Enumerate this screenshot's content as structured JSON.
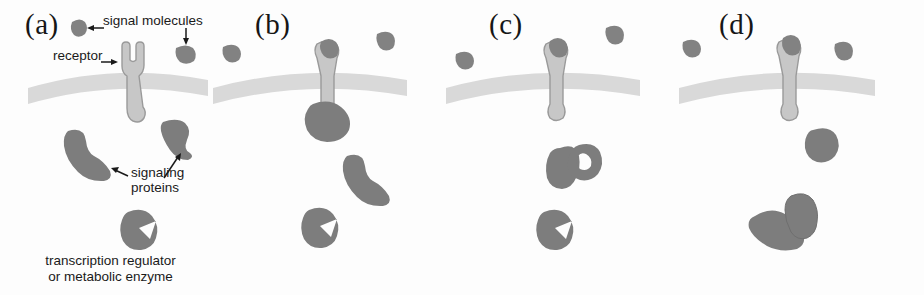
{
  "figure": {
    "type": "diagram",
    "background": "#fdfdfd",
    "width": 924,
    "height": 295
  },
  "colors": {
    "membrane": "#d9d9d9",
    "membrane_edge": "#cccccc",
    "receptor_fill": "#c7c7c7",
    "receptor_stroke": "#9a9a9a",
    "protein_fill": "#7d7d7d",
    "protein_stroke": "#6f6f6f",
    "signal_fill": "#828282",
    "text": "#1a1a1a",
    "panel_label": "#161616"
  },
  "panels": [
    {
      "id": "a",
      "label": "(a)",
      "state": "resting: signal molecules free, receptor unbound, signaling proteins inactive",
      "labels": {
        "signal_molecules": "signal molecules",
        "receptor": "receptor",
        "signaling_proteins_line1": "signaling",
        "signaling_proteins_line2": "proteins",
        "effector_line1": "transcription regulator",
        "effector_line2": "or metabolic enzyme"
      }
    },
    {
      "id": "b",
      "label": "(b)",
      "state": "signal molecule bound in receptor cleft; first signaling protein docked at cytoplasmic tail"
    },
    {
      "id": "c",
      "label": "(c)",
      "state": "two signaling proteins associated in the cytosol"
    },
    {
      "id": "d",
      "label": "(d)",
      "state": "signaling protein bound to transcription regulator or metabolic enzyme"
    }
  ],
  "legend": {
    "signal_molecules": "signal molecules",
    "receptor": "receptor",
    "signaling_proteins": "signaling proteins",
    "effector": "transcription regulator or metabolic enzyme"
  }
}
